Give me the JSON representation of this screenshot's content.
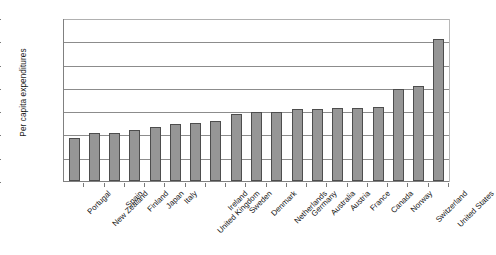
{
  "chart_data": {
    "type": "bar",
    "title": "",
    "subtitle": "",
    "xlabel": "",
    "ylabel": "Per capita expenditures",
    "ylim": [
      0,
      7000
    ],
    "ytick_values": [
      0,
      1000,
      2000,
      3000,
      4000,
      5000,
      6000,
      7000
    ],
    "ytick_labels": [
      "$0",
      "$1,000",
      "$2,000",
      "$3,000",
      "$4,000",
      "$5,000",
      "$6,000",
      "$7,000"
    ],
    "grid": true,
    "legend": "none",
    "bar_color": "#969696",
    "bar_border_color": "#4d4d4d",
    "categories": [
      "Portugal",
      "New Zealand",
      "Spain",
      "Finland",
      "Japan",
      "Italy",
      "United Kingdom",
      "Ireland",
      "Sweden",
      "Denmark",
      "Netherlands",
      "Germany",
      "Australia",
      "Austria",
      "France",
      "Canada",
      "Norway",
      "Switzerland",
      "United States"
    ],
    "values": [
      1830,
      2070,
      2070,
      2200,
      2330,
      2430,
      2490,
      2590,
      2890,
      2960,
      2950,
      3080,
      3080,
      3120,
      3120,
      3170,
      3970,
      4090,
      6100
    ]
  }
}
